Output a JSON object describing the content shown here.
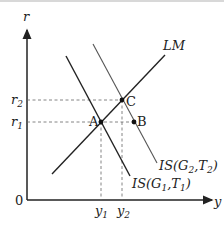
{
  "diagram": {
    "axes": {
      "x_label": "y",
      "y_label": "r",
      "origin_label": "0"
    },
    "y_ticks": [
      {
        "label": "r",
        "sub": "1"
      },
      {
        "label": "r",
        "sub": "2"
      }
    ],
    "x_ticks": [
      {
        "label": "y",
        "sub": "1"
      },
      {
        "label": "y",
        "sub": "2"
      }
    ],
    "curves": {
      "lm": {
        "label": "LM"
      },
      "is1": {
        "label_prefix": "IS(G",
        "sub1": "1",
        "mid": ",T",
        "sub2": "1",
        "suffix": ")"
      },
      "is2": {
        "label_prefix": "IS(G",
        "sub1": "2",
        "mid": ",T",
        "sub2": "2",
        "suffix": ")"
      }
    },
    "points": {
      "a": {
        "label": "A"
      },
      "b": {
        "label": "B"
      },
      "c": {
        "label": "C"
      }
    },
    "colors": {
      "line": "#222222",
      "is2": "#555555",
      "dashed": "#666666"
    }
  }
}
